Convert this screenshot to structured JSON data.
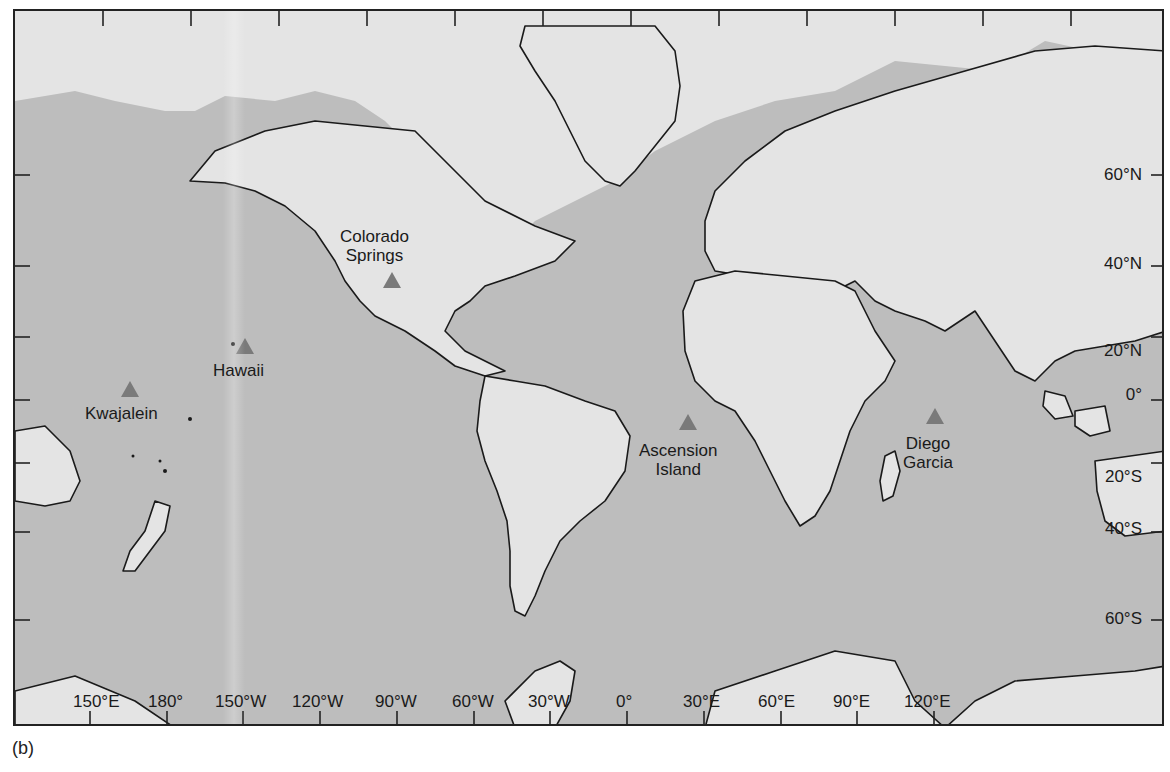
{
  "figure": {
    "caption": "(b)",
    "projection": "Mercator world map",
    "colors": {
      "ocean": "#bdbdbd",
      "land": "#e4e4e4",
      "shelf": "#dcdcdc",
      "coastline": "#1a1a1a",
      "station_marker": "#7a7a7a"
    }
  },
  "stations": [
    {
      "name": "Colorado Springs",
      "line1": "Colorado",
      "line2": "Springs"
    },
    {
      "name": "Hawaii",
      "line1": "Hawaii",
      "line2": ""
    },
    {
      "name": "Kwajalein",
      "line1": "Kwajalein",
      "line2": ""
    },
    {
      "name": "Ascension Island",
      "line1": "Ascension",
      "line2": "Island"
    },
    {
      "name": "Diego Garcia",
      "line1": "Diego",
      "line2": "Garcia"
    }
  ],
  "latitude_labels": [
    "60°N",
    "40°N",
    "20°N",
    "0°",
    "20°S",
    "40°S",
    "60°S"
  ],
  "longitude_labels": [
    "150°E",
    "180°",
    "150°W",
    "120°W",
    "90°W",
    "60°W",
    "30°W",
    "0°",
    "30°E",
    "60°E",
    "90°E",
    "120°E"
  ]
}
